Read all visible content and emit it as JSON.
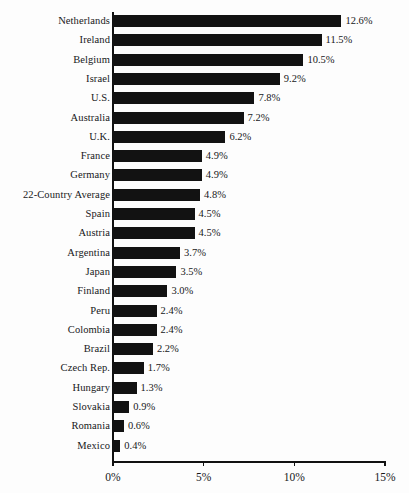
{
  "chart_data": {
    "type": "bar",
    "orientation": "horizontal",
    "title": "",
    "subtitle": "",
    "xlabel": "",
    "ylabel": "",
    "xlim": [
      0,
      15
    ],
    "grid": false,
    "legend": null,
    "value_suffix": "%",
    "bar_color": "#121212",
    "background_color": "#fdfdfd",
    "axis_color": "#111111",
    "text_color": "#17181a",
    "x_ticks": [
      {
        "value": 0,
        "label": "0%"
      },
      {
        "value": 5,
        "label": "5%"
      },
      {
        "value": 10,
        "label": "10%"
      },
      {
        "value": 15,
        "label": "15%"
      }
    ],
    "categories": [
      "Netherlands",
      "Ireland",
      "Belgium",
      "Israel",
      "U.S.",
      "Australia",
      "U.K.",
      "France",
      "Germany",
      "22-Country Average",
      "Spain",
      "Austria",
      "Argentina",
      "Japan",
      "Finland",
      "Peru",
      "Colombia",
      "Brazil",
      "Czech Rep.",
      "Hungary",
      "Slovakia",
      "Romania",
      "Mexico"
    ],
    "values": [
      12.6,
      11.5,
      10.5,
      9.2,
      7.8,
      7.2,
      6.2,
      4.9,
      4.9,
      4.8,
      4.5,
      4.5,
      3.7,
      3.5,
      3.0,
      2.4,
      2.4,
      2.2,
      1.7,
      1.3,
      0.9,
      0.6,
      0.4
    ],
    "data_labels": [
      "12.6%",
      "11.5%",
      "10.5%",
      "9.2%",
      "7.8%",
      "7.2%",
      "6.2%",
      "4.9%",
      "4.9%",
      "4.8%",
      "4.5%",
      "4.5%",
      "3.7%",
      "3.5%",
      "3.0%",
      "2.4%",
      "2.4%",
      "2.2%",
      "1.7%",
      "1.3%",
      "0.9%",
      "0.6%",
      "0.4%"
    ],
    "bars": [
      {
        "category": "Netherlands",
        "value": 12.6,
        "label": "12.6%"
      },
      {
        "category": "Ireland",
        "value": 11.5,
        "label": "11.5%"
      },
      {
        "category": "Belgium",
        "value": 10.5,
        "label": "10.5%"
      },
      {
        "category": "Israel",
        "value": 9.2,
        "label": "9.2%"
      },
      {
        "category": "U.S.",
        "value": 7.8,
        "label": "7.8%"
      },
      {
        "category": "Australia",
        "value": 7.2,
        "label": "7.2%"
      },
      {
        "category": "U.K.",
        "value": 6.2,
        "label": "6.2%"
      },
      {
        "category": "France",
        "value": 4.9,
        "label": "4.9%"
      },
      {
        "category": "Germany",
        "value": 4.9,
        "label": "4.9%"
      },
      {
        "category": "22-Country Average",
        "value": 4.8,
        "label": "4.8%"
      },
      {
        "category": "Spain",
        "value": 4.5,
        "label": "4.5%"
      },
      {
        "category": "Austria",
        "value": 4.5,
        "label": "4.5%"
      },
      {
        "category": "Argentina",
        "value": 3.7,
        "label": "3.7%"
      },
      {
        "category": "Japan",
        "value": 3.5,
        "label": "3.5%"
      },
      {
        "category": "Finland",
        "value": 3.0,
        "label": "3.0%"
      },
      {
        "category": "Peru",
        "value": 2.4,
        "label": "2.4%"
      },
      {
        "category": "Colombia",
        "value": 2.4,
        "label": "2.4%"
      },
      {
        "category": "Brazil",
        "value": 2.2,
        "label": "2.2%"
      },
      {
        "category": "Czech Rep.",
        "value": 1.7,
        "label": "1.7%"
      },
      {
        "category": "Hungary",
        "value": 1.3,
        "label": "1.3%"
      },
      {
        "category": "Slovakia",
        "value": 0.9,
        "label": "0.9%"
      },
      {
        "category": "Romania",
        "value": 0.6,
        "label": "0.6%"
      },
      {
        "category": "Mexico",
        "value": 0.4,
        "label": "0.4%"
      }
    ]
  }
}
